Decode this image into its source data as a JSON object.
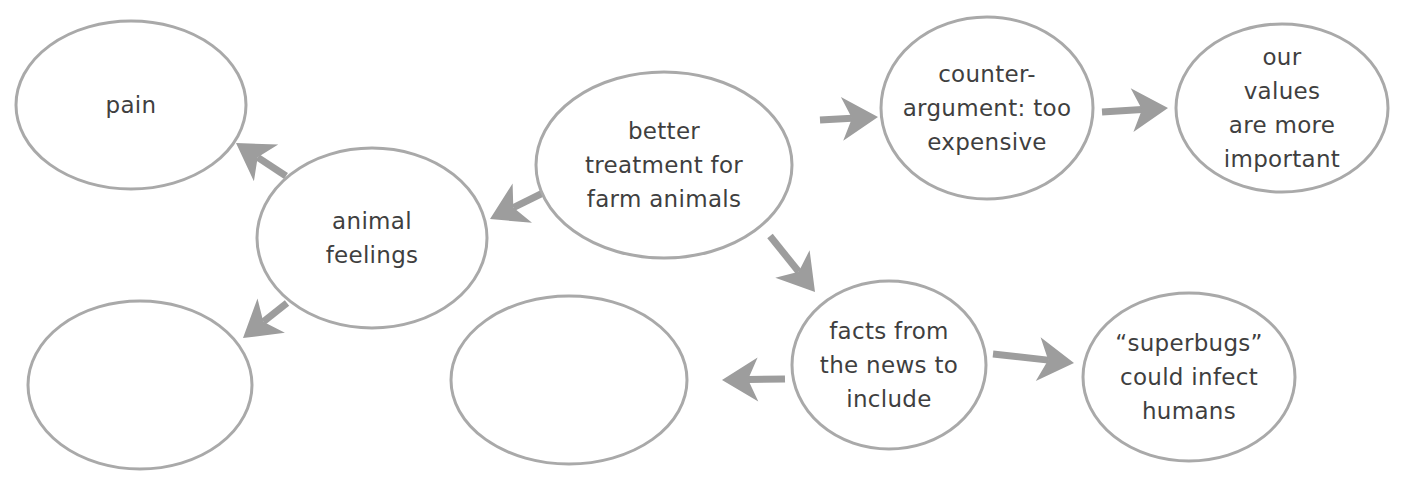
{
  "diagram": {
    "type": "concept-map",
    "colors": {
      "stroke": "#a9a9a9",
      "arrow": "#9d9d9d",
      "text": "#3f3f3f",
      "background": "#ffffff"
    },
    "nodes": [
      {
        "id": "center",
        "label": "better\ntreatment for\nfarm animals",
        "cx": 664,
        "cy": 165,
        "rx": 128,
        "ry": 93
      },
      {
        "id": "animal-feelings",
        "label": "animal\nfeelings",
        "cx": 372,
        "cy": 238,
        "rx": 115,
        "ry": 90
      },
      {
        "id": "pain",
        "label": "pain",
        "cx": 131,
        "cy": 105,
        "rx": 115,
        "ry": 84
      },
      {
        "id": "blank-left",
        "label": "",
        "cx": 140,
        "cy": 385,
        "rx": 112,
        "ry": 84
      },
      {
        "id": "counter-argument",
        "label": "counter-\nargument: too\nexpensive",
        "cx": 987,
        "cy": 108,
        "rx": 106,
        "ry": 91
      },
      {
        "id": "our-values",
        "label": "our values\nare more\nimportant",
        "cx": 1282,
        "cy": 108,
        "rx": 106,
        "ry": 84
      },
      {
        "id": "facts-news",
        "label": "facts from\nthe news to\ninclude",
        "cx": 889,
        "cy": 365,
        "rx": 97,
        "ry": 84
      },
      {
        "id": "blank-middle",
        "label": "",
        "cx": 569,
        "cy": 380,
        "rx": 118,
        "ry": 84
      },
      {
        "id": "superbugs",
        "label": "“superbugs”\ncould infect\nhumans",
        "cx": 1189,
        "cy": 377,
        "rx": 106,
        "ry": 84
      }
    ],
    "edges": [
      {
        "from": "center",
        "to": "animal-feelings",
        "x1": 553,
        "y1": 188,
        "x2": 490,
        "y2": 219
      },
      {
        "from": "animal-feelings",
        "to": "pain",
        "x1": 286,
        "y1": 176,
        "x2": 236,
        "y2": 143
      },
      {
        "from": "animal-feelings",
        "to": "blank-left",
        "x1": 287,
        "y1": 303,
        "x2": 243,
        "y2": 338
      },
      {
        "from": "center",
        "to": "counter-argument",
        "x1": 820,
        "y1": 120,
        "x2": 878,
        "y2": 117
      },
      {
        "from": "counter-argument",
        "to": "our-values",
        "x1": 1102,
        "y1": 112,
        "x2": 1168,
        "y2": 108
      },
      {
        "from": "center",
        "to": "facts-news",
        "x1": 770,
        "y1": 236,
        "x2": 815,
        "y2": 292
      },
      {
        "from": "facts-news",
        "to": "blank-middle",
        "x1": 785,
        "y1": 379,
        "x2": 722,
        "y2": 380
      },
      {
        "from": "facts-news",
        "to": "superbugs",
        "x1": 993,
        "y1": 354,
        "x2": 1074,
        "y2": 363
      }
    ]
  }
}
